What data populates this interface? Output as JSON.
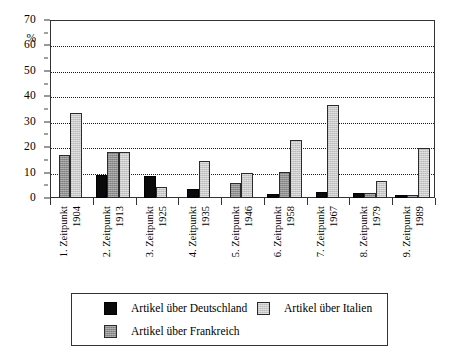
{
  "chart_data": {
    "type": "bar",
    "title": "",
    "subtitle": "",
    "xlabel": "",
    "ylabel": "%",
    "ylim": [
      0,
      70
    ],
    "yticks": [
      0,
      10,
      20,
      30,
      40,
      50,
      60,
      70
    ],
    "ytick_labels": [
      "0",
      "10",
      "20",
      "30",
      "40",
      "50",
      "60",
      "70"
    ],
    "y_minor_step": 5,
    "grid": true,
    "grid_style": "dotted-horizontal",
    "legend_position": "bottom",
    "categories": [
      "1. Zeitpunkt 1904",
      "2. Zeitpunkt 1913",
      "3. Zeitpunkt 1925",
      "4. Zeitpunkt 1935",
      "5. Zeitpunkt 1946",
      "6. Zeitpunkt 1958",
      "7. Zeitpunkt 1967",
      "8. Zeitpunkt 1979",
      "9. Zeitpunkt 1989"
    ],
    "category_lines": [
      [
        "1. Zeitpunkt",
        "1904"
      ],
      [
        "2. Zeitpunkt",
        "1913"
      ],
      [
        "3. Zeitpunkt",
        "1925"
      ],
      [
        "4. Zeitpunkt",
        "1935"
      ],
      [
        "5. Zeitpunkt",
        "1946"
      ],
      [
        "6. Zeitpunkt",
        "1958"
      ],
      [
        "7. Zeitpunkt",
        "1967"
      ],
      [
        "8. Zeitpunkt",
        "1979"
      ],
      [
        "9. Zeitpunkt",
        "1989"
      ]
    ],
    "series": [
      {
        "name": "Artikel über Deutschland",
        "key": "de",
        "color": "#0a0a0a",
        "values": [
          0,
          9,
          8.8,
          3.6,
          0,
          1.6,
          2.4,
          1.9,
          1.2
        ]
      },
      {
        "name": "Artikel über Frankreich",
        "key": "fr",
        "color": "#8f8f8f",
        "values": [
          16.8,
          18,
          0,
          0,
          5.8,
          10.3,
          0,
          1.8,
          1.1
        ]
      },
      {
        "name": "Artikel über Italien",
        "key": "it",
        "color": "#c9c9c9",
        "values": [
          33.4,
          18,
          4.2,
          14.5,
          9.8,
          22.7,
          36.4,
          6.5,
          19.6
        ]
      }
    ]
  },
  "legend": {
    "items": [
      {
        "label": "Artikel über Deutschland",
        "key": "de"
      },
      {
        "label": "Artikel über Italien",
        "key": "it"
      },
      {
        "label": "Artikel über Frankreich",
        "key": "fr"
      }
    ]
  },
  "axis": {
    "y_unit": "%"
  }
}
